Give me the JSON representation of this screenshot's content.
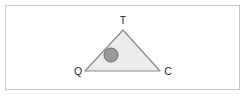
{
  "figure": {
    "background_color": "#ffffff",
    "frame": {
      "border_color": "#c9c9c9",
      "fill_color": "#ffffff"
    },
    "triangle": {
      "fill_color": "#ededed",
      "stroke_color": "#8a8a8a",
      "vertices": [
        {
          "id": "T",
          "label": "T",
          "x": 123,
          "y": 30
        },
        {
          "id": "Q",
          "label": "Q",
          "x": 85,
          "y": 71
        },
        {
          "id": "C",
          "label": "C",
          "x": 160,
          "y": 71
        }
      ]
    },
    "circle": {
      "label": "",
      "fill_color": "#9a9a9a",
      "stroke_color": "#6a6a6a",
      "cx": 111,
      "cy": 55,
      "r": 7
    },
    "labels": {
      "apex": "T",
      "bottom_left": "Q",
      "bottom_right": "C"
    }
  }
}
